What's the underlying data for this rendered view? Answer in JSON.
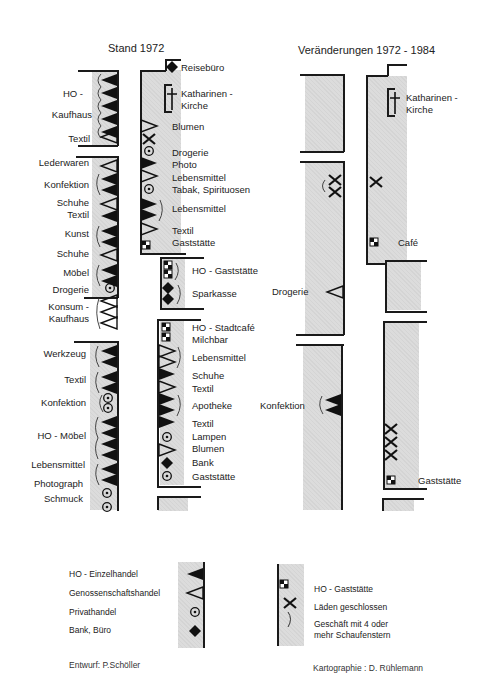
{
  "titles": {
    "left": "Stand 1972",
    "right": "Veränderungen 1972 - 1984"
  },
  "stand1972": {
    "west_side": [
      {
        "label": "HO -",
        "symbols": "HO-Einzelhandel"
      },
      {
        "label": "Kaufhaus",
        "symbols": "HO-Einzelhandel x5, Schaufenster"
      },
      {
        "label": "Textil",
        "symbols": "Genossenschaftshandel"
      },
      {
        "label": "Lederwaren",
        "symbols": "Genossenschaftshandel"
      },
      {
        "label": "Konfektion",
        "symbols": "HO-Einzelhandel x2, Schaufenster"
      },
      {
        "label": "Schuhe",
        "symbols": "Genossenschaftshandel"
      },
      {
        "label": "Textil",
        "symbols": "HO-Einzelhandel"
      },
      {
        "label": "Kunst",
        "symbols": "HO-Einzelhandel x2, Schaufenster"
      },
      {
        "label": "Schuhe",
        "symbols": "Genossenschaftshandel"
      },
      {
        "label": "Möbel",
        "symbols": "HO-Einzelhandel x2, Schaufenster"
      },
      {
        "label": "Drogerie",
        "symbols": "Privathandel"
      },
      {
        "label": "Konsum -",
        "symbols": "Genossenschaftshandel"
      },
      {
        "label": "Kaufhaus",
        "symbols": "Genossenschaftshandel x3, Schaufenster"
      },
      {
        "label": "Werkzeug",
        "symbols": "HO-Einzelhandel x2, Schaufenster"
      },
      {
        "label": "Textil",
        "symbols": "HO-Einzelhandel x2, Schaufenster"
      },
      {
        "label": "Konfektion",
        "symbols": "Privathandel x2, Schaufenster"
      },
      {
        "label": "HO - Möbel",
        "symbols": "HO-Einzelhandel x4, Schaufenster"
      },
      {
        "label": "Lebensmittel",
        "symbols": "HO-Einzelhandel x2, Schaufenster"
      },
      {
        "label": "Photograph",
        "symbols": "Privathandel"
      },
      {
        "label": "Schmuck",
        "symbols": "Privathandel"
      }
    ],
    "east_side": [
      {
        "label": "Reisebüro",
        "symbols": "Bank, Büro"
      },
      {
        "label": "Katharinen -",
        "symbols": "Kirche"
      },
      {
        "label": "Kirche",
        "symbols": ""
      },
      {
        "label": "Blumen",
        "symbols": "Genossenschaftshandel"
      },
      {
        "label": "Drogerie",
        "symbols": "Läden geschlossen, Privathandel"
      },
      {
        "label": "Photo",
        "symbols": "HO-Einzelhandel"
      },
      {
        "label": "Lebensmittel",
        "symbols": "Genossenschaftshandel"
      },
      {
        "label": "Tabak, Spirituosen",
        "symbols": "Privathandel"
      },
      {
        "label": "Lebensmittel",
        "symbols": "HO-Einzelhandel x2, Schaufenster"
      },
      {
        "label": "Textil",
        "symbols": "Genossenschaftshandel"
      },
      {
        "label": "Gaststätte",
        "symbols": "HO-Gaststätte"
      },
      {
        "label": "HO - Gaststätte",
        "symbols": "HO-Gaststätte x2, Schaufenster"
      },
      {
        "label": "Sparkasse",
        "symbols": "Bank, Büro x2, Schaufenster"
      },
      {
        "label": "HO - Stadtcafé",
        "symbols": "HO-Gaststätte"
      },
      {
        "label": "Milchbar",
        "symbols": "HO-Gaststätte"
      },
      {
        "label": "Lebensmittel",
        "symbols": "Genossenschaftshandel x2, Schaufenster"
      },
      {
        "label": "Schuhe",
        "symbols": "HO-Einzelhandel"
      },
      {
        "label": "Textil",
        "symbols": "Genossenschaftshandel"
      },
      {
        "label": "Apotheke",
        "symbols": "HO-Einzelhandel x2, Schaufenster"
      },
      {
        "label": "Textil",
        "symbols": "HO-Einzelhandel"
      },
      {
        "label": "Lampen",
        "symbols": "Privathandel"
      },
      {
        "label": "Blumen",
        "symbols": "Genossenschaftshandel"
      },
      {
        "label": "Bank",
        "symbols": "Bank, Büro"
      },
      {
        "label": "Gaststätte",
        "symbols": "Privathandel"
      }
    ]
  },
  "changes": {
    "labels": {
      "katharinen1": "Katharinen -",
      "katharinen2": "Kirche",
      "cafe": "Café",
      "drogerie": "Drogerie",
      "konfektion": "Konfektion",
      "gaststaette": "Gaststätte"
    }
  },
  "legend": {
    "left": [
      {
        "label": "HO - Einzelhandel",
        "icon": "filled-triangle"
      },
      {
        "label": "Genossenschaftshandel",
        "icon": "open-triangle"
      },
      {
        "label": "Privathandel",
        "icon": "circle-dot"
      },
      {
        "label": "Bank, Büro",
        "icon": "diamond"
      }
    ],
    "right": [
      {
        "label": "HO - Gaststätte",
        "icon": "checker-square"
      },
      {
        "label": "Läden geschlossen",
        "icon": "x-cross"
      },
      {
        "label": "Geschäft mit 4 oder",
        "icon": "bracket"
      },
      {
        "label": "mehr Schaufenstern",
        "icon": ""
      }
    ]
  },
  "credits": {
    "design": "Entwurf: P.Schöller",
    "cartography": "Kartographie : D. Rühlemann"
  },
  "colors": {
    "shade": "#dcdcdc",
    "ink": "#1a1a1a"
  }
}
